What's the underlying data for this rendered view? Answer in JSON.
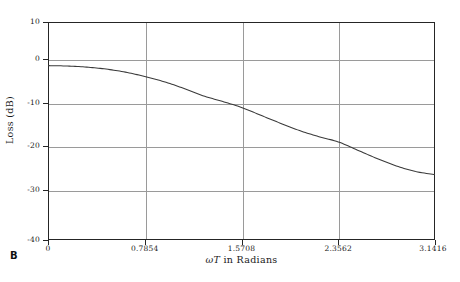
{
  "panel": {
    "letter": "B"
  },
  "axes": {
    "ylabel": "Loss (dB)",
    "xlabel_omega": "ω",
    "xlabel_T": "T",
    "xlabel_rest": " in Radians",
    "xlabel_full": "ωT in Radians",
    "y_ticks": [
      "10",
      "0",
      "-10",
      "-20",
      "-30",
      "-40"
    ],
    "x_ticks": [
      "0",
      "0.7854",
      "1.5708",
      "2.3562",
      "3.1416"
    ]
  },
  "colors": {
    "frame": "#252525",
    "grid": "#9a9a9a",
    "curve": "#3a3a3a",
    "background": "#ffffff",
    "text": "#1a1a1a"
  },
  "chart_data": {
    "type": "line",
    "title": "",
    "xlabel": "ωT in Radians",
    "ylabel": "Loss (dB)",
    "xlim": [
      0,
      3.1416
    ],
    "ylim": [
      -40,
      10
    ],
    "xticks": [
      0,
      0.7854,
      1.5708,
      2.3562,
      3.1416
    ],
    "xticklabels": [
      "0",
      "0.7854",
      "1.5708",
      "2.3562",
      "3.1416"
    ],
    "yticks": [
      10,
      0,
      -10,
      -20,
      -30,
      -40
    ],
    "yticklabels": [
      "10",
      "0",
      "-10",
      "-20",
      "-30",
      "-40"
    ],
    "grid": true,
    "legend": null,
    "series": [
      {
        "name": "Loss",
        "x": [
          0.0,
          0.1571,
          0.3142,
          0.4712,
          0.6283,
          0.7854,
          0.9425,
          1.0996,
          1.2566,
          1.4137,
          1.5708,
          1.7279,
          1.885,
          2.042,
          2.1991,
          2.3562,
          2.5133,
          2.6704,
          2.8274,
          2.9845,
          3.1416
        ],
        "y": [
          0.0,
          -0.1,
          -0.35,
          -0.8,
          -1.5,
          -2.5,
          -3.7,
          -5.2,
          -6.9,
          -8.2,
          -9.6,
          -11.4,
          -13.2,
          -14.9,
          -16.3,
          -17.5,
          -19.4,
          -21.3,
          -23.0,
          -24.3,
          -25.0
        ]
      }
    ]
  }
}
